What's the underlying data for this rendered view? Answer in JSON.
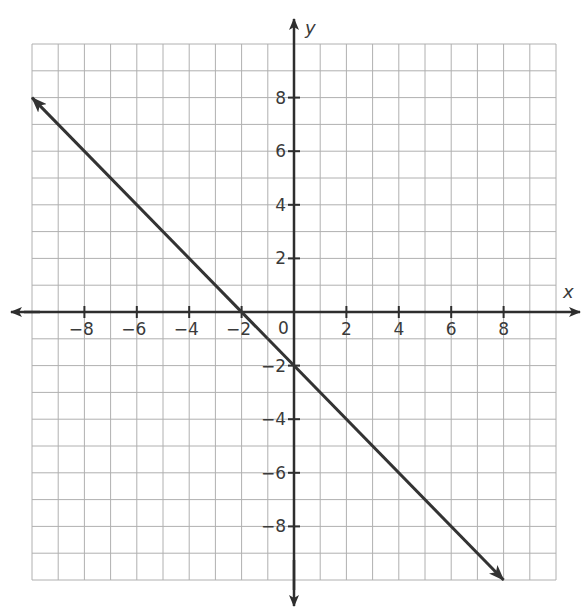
{
  "chart_data": {
    "type": "line",
    "title": "",
    "xlabel": "x",
    "ylabel": "y",
    "xlim": [
      -10,
      10
    ],
    "ylim": [
      -10,
      10
    ],
    "grid": true,
    "grid_step": 1,
    "x_ticks": [
      -8,
      -6,
      -4,
      -2,
      2,
      4,
      6,
      8
    ],
    "x_tick_labels": [
      "−8",
      "−6",
      "−4",
      "−2",
      "2",
      "4",
      "6",
      "8"
    ],
    "y_ticks": [
      8,
      6,
      4,
      2,
      -2,
      -4,
      -6,
      -8
    ],
    "y_tick_labels": [
      "8",
      "6",
      "4",
      "2",
      "−2",
      "−4",
      "−6",
      "−8"
    ],
    "origin_label": "0",
    "series": [
      {
        "name": "line",
        "equation": "y = -x - 2",
        "x": [
          -10,
          8
        ],
        "y": [
          8,
          -10
        ],
        "arrows": "both",
        "color": "#333333"
      }
    ],
    "legend": null
  },
  "colors": {
    "grid": "#b0b0b0",
    "axes": "#2e2e2e",
    "text": "#3a3a3a"
  }
}
